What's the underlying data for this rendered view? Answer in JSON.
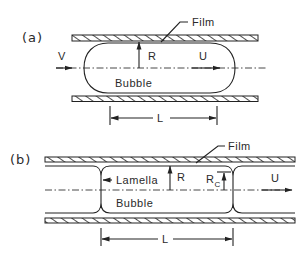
{
  "figure": {
    "panels": [
      {
        "id": "a",
        "label": "(a)",
        "labels": {
          "film": "Film",
          "velocity_in": "V",
          "radius": "R",
          "bubble_velocity": "U",
          "bubble": "Bubble",
          "length": "L"
        }
      },
      {
        "id": "b",
        "label": "(b)",
        "labels": {
          "film": "Film",
          "lamella": "Lamella",
          "radius": "R",
          "radius_c_main": "R",
          "radius_c_sub": "C",
          "bubble_velocity": "U",
          "bubble": "Bubble",
          "length": "L"
        }
      }
    ],
    "colors": {
      "ink": "#222222",
      "background": "#ffffff"
    }
  }
}
